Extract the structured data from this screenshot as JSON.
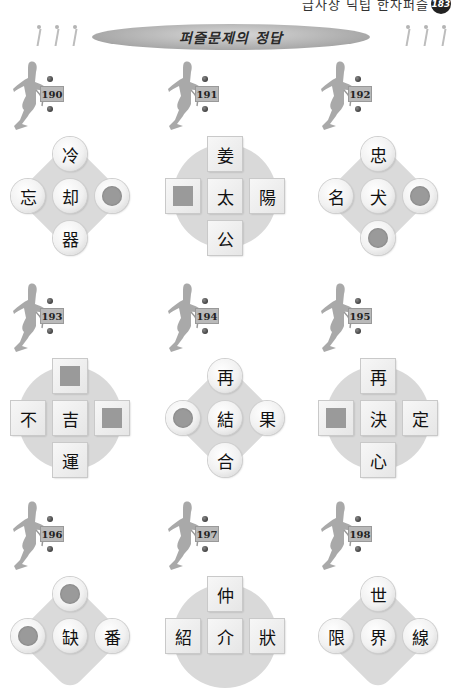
{
  "header": {
    "running_title": "급사장 닉팁 한자퍼즐",
    "page_number": "183",
    "banner_title": "퍼즐문제의 정답"
  },
  "puzzles": [
    {
      "number": "190",
      "shape": "circle",
      "bg": "diamond",
      "tiles": {
        "top": "冷",
        "left": "忘",
        "center": "却",
        "right": "",
        "bottom": "器"
      },
      "blanks": [
        "right"
      ]
    },
    {
      "number": "191",
      "shape": "square",
      "bg": "disc",
      "tiles": {
        "top": "姜",
        "left": "",
        "center": "太",
        "right": "陽",
        "bottom": "公"
      },
      "blanks": [
        "left"
      ]
    },
    {
      "number": "192",
      "shape": "circle",
      "bg": "diamond",
      "tiles": {
        "top": "忠",
        "left": "名",
        "center": "犬",
        "right": "",
        "bottom": ""
      },
      "blanks": [
        "right",
        "bottom"
      ]
    },
    {
      "number": "193",
      "shape": "square",
      "bg": "disc",
      "tiles": {
        "top": "",
        "left": "不",
        "center": "吉",
        "right": "",
        "bottom": "運"
      },
      "blanks": [
        "top",
        "right"
      ]
    },
    {
      "number": "194",
      "shape": "circle",
      "bg": "diamond",
      "tiles": {
        "top": "再",
        "left": "",
        "center": "結",
        "right": "果",
        "bottom": "合"
      },
      "blanks": [
        "left"
      ]
    },
    {
      "number": "195",
      "shape": "square",
      "bg": "disc",
      "tiles": {
        "top": "再",
        "left": "",
        "center": "決",
        "right": "定",
        "bottom": "心"
      },
      "blanks": [
        "left"
      ]
    },
    {
      "number": "196",
      "shape": "circle",
      "bg": "diamond",
      "tiles": {
        "top": "",
        "left": "",
        "center": "缺",
        "right": "番",
        "bottom": ""
      },
      "blanks": [
        "top",
        "left"
      ]
    },
    {
      "number": "197",
      "shape": "square",
      "bg": "disc",
      "tiles": {
        "top": "仲",
        "left": "紹",
        "center": "介",
        "right": "狀",
        "bottom": ""
      },
      "blanks": []
    },
    {
      "number": "198",
      "shape": "circle",
      "bg": "diamond",
      "tiles": {
        "top": "世",
        "left": "限",
        "center": "界",
        "right": "線",
        "bottom": ""
      },
      "blanks": []
    }
  ],
  "colors": {
    "tile_background": "#f1f1f1",
    "blank_fill": "#9a9a9a",
    "puzzle_background": "#d9d9d9",
    "banner": "#a8a8a8"
  }
}
